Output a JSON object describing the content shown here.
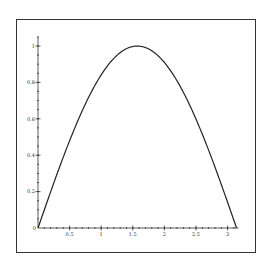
{
  "chart_data": {
    "type": "line",
    "title": "",
    "xlabel": "",
    "ylabel": "",
    "function": "sin(x)",
    "xlim": [
      0,
      3.1416
    ],
    "ylim": [
      0,
      1
    ],
    "grid": false,
    "legend": null,
    "x_ticks": [
      "0.5",
      "1",
      "1.5",
      "2",
      "2.5",
      "3"
    ],
    "y_ticks": [
      "0.2",
      "0.4",
      "0.6",
      "0.8",
      "1"
    ],
    "origin_label": "0",
    "series": [
      {
        "name": "sin(x)",
        "x": [
          0,
          0.1571,
          0.3142,
          0.4712,
          0.6283,
          0.7854,
          0.9425,
          1.0996,
          1.2566,
          1.4137,
          1.5708,
          1.7279,
          1.885,
          2.042,
          2.1991,
          2.3562,
          2.5133,
          2.6704,
          2.8274,
          2.9845,
          3.1416
        ],
        "values": [
          0,
          0.156,
          0.309,
          0.454,
          0.588,
          0.707,
          0.809,
          0.891,
          0.951,
          0.988,
          1.0,
          0.988,
          0.951,
          0.891,
          0.809,
          0.707,
          0.588,
          0.454,
          0.309,
          0.156,
          0
        ],
        "color": "#222222"
      }
    ]
  },
  "colors": {
    "line": "#222222",
    "axis": "#333333",
    "frame": "#333333",
    "background": "#ffffff"
  }
}
